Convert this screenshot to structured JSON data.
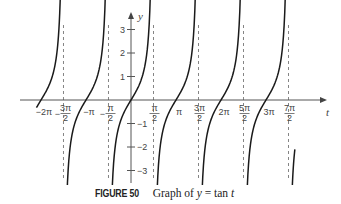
{
  "chart_data": {
    "type": "line",
    "title": "Graph of y = tan t",
    "xlabel": "t",
    "ylabel": "y",
    "function": "tan",
    "x_range": [
      -6.95,
      11.8
    ],
    "ylim": [
      -3,
      3
    ],
    "x_ticks": [
      {
        "value": -6.2832,
        "label": "−2π",
        "frac": false
      },
      {
        "value": -4.7124,
        "label_num": "3π",
        "label_den": "2",
        "sign": "−",
        "frac": true
      },
      {
        "value": -3.1416,
        "label": "−π",
        "frac": false
      },
      {
        "value": -1.5708,
        "label_num": "π",
        "label_den": "2",
        "sign": "−",
        "frac": true
      },
      {
        "value": 1.5708,
        "label_num": "π",
        "label_den": "2",
        "sign": "",
        "frac": true
      },
      {
        "value": 3.1416,
        "label": "π",
        "frac": false
      },
      {
        "value": 4.7124,
        "label_num": "3π",
        "label_den": "2",
        "sign": "",
        "frac": true
      },
      {
        "value": 6.2832,
        "label": "2π",
        "frac": false
      },
      {
        "value": 7.854,
        "label_num": "5π",
        "label_den": "2",
        "sign": "",
        "frac": true
      },
      {
        "value": 9.4248,
        "label": "3π",
        "frac": false
      },
      {
        "value": 10.9956,
        "label_num": "7π",
        "label_den": "2",
        "sign": "",
        "frac": true
      }
    ],
    "y_ticks": [
      {
        "value": 3,
        "label": "3"
      },
      {
        "value": 2,
        "label": "2"
      },
      {
        "value": 1,
        "label": "1"
      },
      {
        "value": -1,
        "label": "−1"
      },
      {
        "value": -2,
        "label": "−2"
      },
      {
        "value": -3,
        "label": "−3"
      }
    ],
    "asymptotes": [
      -4.7124,
      -1.5708,
      1.5708,
      4.7124,
      7.854,
      10.9956
    ],
    "branches": [
      {
        "t_start": -6.6,
        "t_end": -4.92
      },
      {
        "t_start": -4.48,
        "t_end": -1.78
      },
      {
        "t_start": -1.35,
        "t_end": 1.36
      },
      {
        "t_start": 1.78,
        "t_end": 4.5
      },
      {
        "t_start": 4.92,
        "t_end": 7.64
      },
      {
        "t_start": 8.07,
        "t_end": 10.78
      },
      {
        "t_start": 11.21,
        "t_end": 11.44
      }
    ],
    "grid": false,
    "legend": null
  },
  "caption": {
    "label": "FIGURE 50",
    "text": "Graph of y = tan t"
  },
  "style": {
    "curve_color": "#1a1a1a",
    "axis_color": "#555555",
    "asymptote_color": "#777777"
  }
}
